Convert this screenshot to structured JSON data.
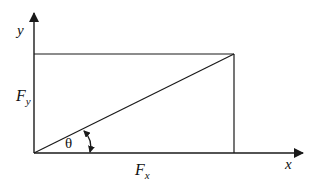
{
  "diagram": {
    "type": "force-component-decomposition",
    "colors": {
      "line": "#1a1a1a",
      "background": "#ffffff",
      "text": "#111111"
    },
    "axes": {
      "x_label": "x",
      "y_label": "y"
    },
    "components": {
      "fx_label": "F",
      "fx_sub": "x",
      "fy_label": "F",
      "fy_sub": "y"
    },
    "angle": {
      "symbol": "θ"
    }
  }
}
